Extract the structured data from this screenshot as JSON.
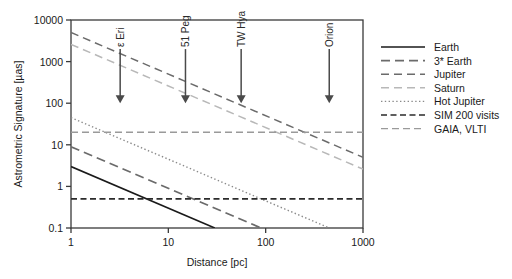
{
  "chart_data": {
    "type": "line",
    "title": "",
    "xlabel": "Distance [pc]",
    "ylabel": "Astrometric Signature [µas]",
    "xscale": "log",
    "yscale": "log",
    "xlim": [
      1,
      1000
    ],
    "ylim": [
      0.1,
      10000
    ],
    "xticks": [
      1,
      10,
      100,
      1000
    ],
    "xticklabels": [
      "1",
      "10",
      "100",
      "1000"
    ],
    "yticks": [
      0.1,
      1,
      10,
      100,
      1000,
      10000
    ],
    "yticklabels": [
      "0.1",
      "1",
      "10",
      "100",
      "1000",
      "10000"
    ],
    "grid": false,
    "legend_position": "right-outside",
    "series": [
      {
        "name": "Earth",
        "style": "solid",
        "color": "#1a1a1a",
        "width": 1.6,
        "x": [
          1,
          1000
        ],
        "y": [
          3.0,
          0.003
        ],
        "note": "falls as 1/d; reaches 0.1 at about 30 pc"
      },
      {
        "name": "3* Earth",
        "style": "long-dash",
        "color": "#6b6b6b",
        "width": 1.8,
        "x": [
          1,
          1000
        ],
        "y": [
          9.0,
          0.009
        ],
        "note": "falls as 1/d; reaches 0.1 at about 90 pc"
      },
      {
        "name": "Jupiter",
        "style": "dash",
        "color": "#6b6b6b",
        "width": 1.5,
        "x": [
          1,
          1000
        ],
        "y": [
          5000,
          5.0
        ]
      },
      {
        "name": "Saturn",
        "style": "dash-light",
        "color": "#b8b8b8",
        "width": 1.5,
        "x": [
          1,
          1000
        ],
        "y": [
          2600,
          2.6
        ]
      },
      {
        "name": "Hot Jupiter",
        "style": "dotted",
        "color": "#8a8a8a",
        "width": 1.4,
        "x": [
          1,
          1000
        ],
        "y": [
          45,
          0.045
        ]
      },
      {
        "name": "SIM 200 visits",
        "style": "dashed-heavy",
        "color": "#2b2b2b",
        "width": 1.7,
        "x": [
          1,
          1000
        ],
        "y": [
          0.5,
          0.5
        ],
        "note": "horizontal detection limit"
      },
      {
        "name": "GAIA, VLTI",
        "style": "dash-dot-light",
        "color": "#9a9a9a",
        "width": 1.4,
        "x": [
          1,
          1000
        ],
        "y": [
          20,
          20
        ],
        "note": "horizontal detection limit"
      }
    ],
    "annotations": [
      {
        "label": "ε Eri",
        "x": 3.2,
        "arrow_to_y": 100
      },
      {
        "label": "51 Peg",
        "x": 15,
        "arrow_to_y": 100
      },
      {
        "label": "TW Hya",
        "x": 56,
        "arrow_to_y": 100
      },
      {
        "label": "Orion",
        "x": 450,
        "arrow_to_y": 100
      }
    ]
  },
  "legend": {
    "items": [
      {
        "label": "Earth"
      },
      {
        "label": "3* Earth"
      },
      {
        "label": "Jupiter"
      },
      {
        "label": "Saturn"
      },
      {
        "label": "Hot Jupiter"
      },
      {
        "label": "SIM 200 visits"
      },
      {
        "label": "GAIA, VLTI"
      }
    ]
  }
}
